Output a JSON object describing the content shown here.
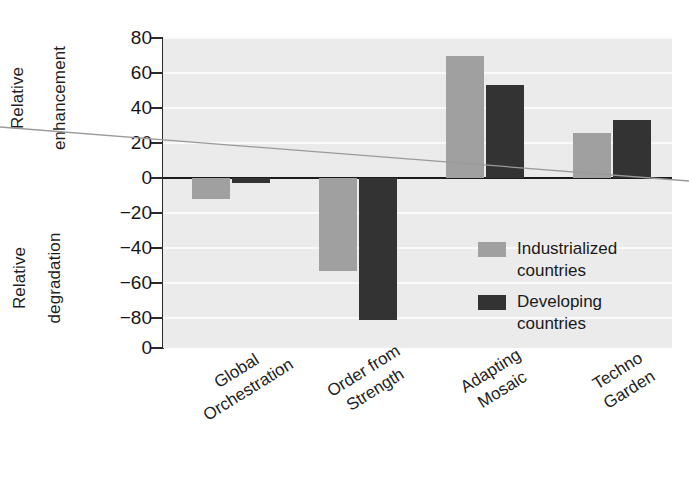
{
  "chart_data": {
    "type": "bar",
    "title": "",
    "xlabel": "",
    "ylabel": "Relative enhancement / Relative degradation",
    "categories": [
      "Global Orchestration",
      "Order from Strength",
      "Adapting Mosaic",
      "Techno Garden"
    ],
    "series": [
      {
        "name": "Industrialized countries",
        "color": "#a0a0a0",
        "values": [
          -12,
          -53,
          70,
          26
        ]
      },
      {
        "name": "Developing countries",
        "color": "#333333",
        "values": [
          -3,
          -81,
          53,
          33
        ]
      }
    ],
    "ylim": [
      -100,
      80
    ],
    "yticks": [
      80,
      60,
      40,
      20,
      0,
      -20,
      -40,
      -60,
      -80,
      0
    ],
    "ytick_labels": [
      "80",
      "60",
      "40",
      "20",
      "0",
      "−20",
      "−40",
      "−60",
      "−80",
      "0"
    ],
    "grid": true,
    "legend_position": "inside-right"
  },
  "axis": {
    "y_upper_title_line1": "Relative",
    "y_upper_title_line2": "enhancement",
    "y_lower_title_line1": "Relative",
    "y_lower_title_line2": "degradation"
  },
  "categories_wrapped": [
    {
      "line1": "Global",
      "line2": "Orchestration"
    },
    {
      "line1": "Order from",
      "line2": "Strength"
    },
    {
      "line1": "Adapting",
      "line2": "Mosaic"
    },
    {
      "line1": "Techno",
      "line2": "Garden"
    }
  ],
  "legend": {
    "items": [
      {
        "line1": "Industrialized",
        "line2": "countries",
        "color": "#a0a0a0"
      },
      {
        "line1": "Developing",
        "line2": "countries",
        "color": "#333333"
      }
    ]
  },
  "colors": {
    "plot_background": "#ebebeb",
    "gridline": "#fafafa",
    "axis": "#1c1c1c",
    "industrialized": "#a0a0a0",
    "developing": "#333333"
  }
}
